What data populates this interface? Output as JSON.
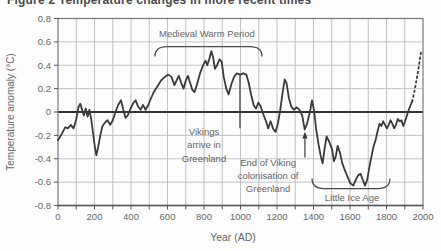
{
  "chart_data": {
    "type": "line",
    "title": "Figure 2 Temperature changes in more recent times",
    "xlabel": "Year (AD)",
    "ylabel": "Temperature anomaly (°C)",
    "xlim": [
      0,
      2000
    ],
    "ylim": [
      -0.8,
      0.8
    ],
    "grid": true,
    "legend": "none",
    "x_ticks": [
      0,
      200,
      400,
      600,
      800,
      1000,
      1200,
      1400,
      1600,
      1800,
      2000
    ],
    "x_minor_step": 100,
    "y_ticks": [
      0.8,
      0.6,
      0.4,
      0.2,
      0,
      -0.2,
      -0.4,
      -0.6,
      -0.8
    ],
    "y_tick_labels": [
      "0.8",
      "0.6",
      "0.4",
      "0.2",
      "0",
      "-0.2",
      "-0.4",
      "-0.6",
      "-0.8"
    ],
    "curve_color": "#3a3a3a",
    "series": [
      {
        "name": "temperature anomaly (reconstructed, solid)",
        "style": "solid",
        "points": [
          [
            0,
            -0.24
          ],
          [
            20,
            -0.19
          ],
          [
            40,
            -0.13
          ],
          [
            55,
            -0.14
          ],
          [
            70,
            -0.11
          ],
          [
            85,
            -0.14
          ],
          [
            100,
            -0.06
          ],
          [
            112,
            0.04
          ],
          [
            122,
            0.07
          ],
          [
            132,
            0.02
          ],
          [
            142,
            -0.03
          ],
          [
            152,
            0.03
          ],
          [
            162,
            -0.04
          ],
          [
            172,
            0.02
          ],
          [
            182,
            -0.06
          ],
          [
            192,
            -0.18
          ],
          [
            202,
            -0.3
          ],
          [
            210,
            -0.37
          ],
          [
            220,
            -0.3
          ],
          [
            232,
            -0.2
          ],
          [
            244,
            -0.12
          ],
          [
            258,
            -0.09
          ],
          [
            272,
            -0.07
          ],
          [
            286,
            -0.11
          ],
          [
            300,
            -0.07
          ],
          [
            315,
            0
          ],
          [
            330,
            0.06
          ],
          [
            345,
            0.1
          ],
          [
            358,
            0.02
          ],
          [
            370,
            -0.05
          ],
          [
            382,
            -0.03
          ],
          [
            395,
            0.02
          ],
          [
            410,
            0.07
          ],
          [
            425,
            0.1
          ],
          [
            438,
            0.05
          ],
          [
            452,
            0.02
          ],
          [
            466,
            0.06
          ],
          [
            480,
            0.02
          ],
          [
            495,
            0.06
          ],
          [
            510,
            0.12
          ],
          [
            525,
            0.17
          ],
          [
            545,
            0.22
          ],
          [
            565,
            0.27
          ],
          [
            585,
            0.3
          ],
          [
            605,
            0.32
          ],
          [
            622,
            0.3
          ],
          [
            638,
            0.23
          ],
          [
            650,
            0.27
          ],
          [
            662,
            0.31
          ],
          [
            675,
            0.25
          ],
          [
            688,
            0.2
          ],
          [
            700,
            0.27
          ],
          [
            712,
            0.31
          ],
          [
            724,
            0.25
          ],
          [
            736,
            0.19
          ],
          [
            748,
            0.17
          ],
          [
            762,
            0.24
          ],
          [
            778,
            0.33
          ],
          [
            795,
            0.4
          ],
          [
            808,
            0.44
          ],
          [
            818,
            0.4
          ],
          [
            830,
            0.46
          ],
          [
            840,
            0.52
          ],
          [
            850,
            0.47
          ],
          [
            860,
            0.37
          ],
          [
            872,
            0.4
          ],
          [
            885,
            0.45
          ],
          [
            897,
            0.43
          ],
          [
            908,
            0.3
          ],
          [
            922,
            0.2
          ],
          [
            935,
            0.15
          ],
          [
            950,
            0.24
          ],
          [
            965,
            0.3
          ],
          [
            980,
            0.33
          ],
          [
            1000,
            0.32
          ],
          [
            1015,
            0.33
          ],
          [
            1032,
            0.32
          ],
          [
            1045,
            0.25
          ],
          [
            1058,
            0.15
          ],
          [
            1072,
            0.06
          ],
          [
            1085,
            0.03
          ],
          [
            1098,
            0.08
          ],
          [
            1110,
            0.05
          ],
          [
            1125,
            -0.02
          ],
          [
            1140,
            -0.08
          ],
          [
            1152,
            -0.14
          ],
          [
            1165,
            -0.08
          ],
          [
            1178,
            -0.14
          ],
          [
            1192,
            -0.17
          ],
          [
            1205,
            -0.1
          ],
          [
            1218,
            0.02
          ],
          [
            1230,
            0.16
          ],
          [
            1242,
            0.28
          ],
          [
            1252,
            0.25
          ],
          [
            1265,
            0.12
          ],
          [
            1278,
            0.05
          ],
          [
            1292,
            0.02
          ],
          [
            1308,
            0.04
          ],
          [
            1322,
            0.02
          ],
          [
            1338,
            -0.03
          ],
          [
            1352,
            -0.15
          ],
          [
            1365,
            -0.1
          ],
          [
            1380,
            0
          ],
          [
            1392,
            0.1
          ],
          [
            1402,
            0.02
          ],
          [
            1415,
            -0.15
          ],
          [
            1428,
            -0.28
          ],
          [
            1440,
            -0.38
          ],
          [
            1450,
            -0.44
          ],
          [
            1462,
            -0.3
          ],
          [
            1472,
            -0.21
          ],
          [
            1482,
            -0.24
          ],
          [
            1492,
            -0.28
          ],
          [
            1502,
            -0.32
          ],
          [
            1512,
            -0.42
          ],
          [
            1522,
            -0.38
          ],
          [
            1532,
            -0.29
          ],
          [
            1545,
            -0.35
          ],
          [
            1558,
            -0.44
          ],
          [
            1572,
            -0.5
          ],
          [
            1588,
            -0.56
          ],
          [
            1602,
            -0.61
          ],
          [
            1618,
            -0.63
          ],
          [
            1632,
            -0.58
          ],
          [
            1645,
            -0.54
          ],
          [
            1658,
            -0.53
          ],
          [
            1670,
            -0.58
          ],
          [
            1682,
            -0.63
          ],
          [
            1694,
            -0.58
          ],
          [
            1705,
            -0.48
          ],
          [
            1715,
            -0.4
          ],
          [
            1728,
            -0.3
          ],
          [
            1740,
            -0.24
          ],
          [
            1752,
            -0.16
          ],
          [
            1762,
            -0.1
          ],
          [
            1772,
            -0.12
          ],
          [
            1782,
            -0.08
          ],
          [
            1792,
            -0.11
          ],
          [
            1802,
            -0.14
          ],
          [
            1812,
            -0.11
          ],
          [
            1822,
            -0.07
          ],
          [
            1832,
            -0.1
          ],
          [
            1842,
            -0.14
          ],
          [
            1852,
            -0.11
          ],
          [
            1862,
            -0.06
          ],
          [
            1872,
            -0.08
          ],
          [
            1882,
            -0.07
          ],
          [
            1892,
            -0.12
          ],
          [
            1902,
            -0.08
          ],
          [
            1912,
            -0.03
          ],
          [
            1922,
            0.02
          ],
          [
            1932,
            0.06
          ],
          [
            1940,
            0.09
          ]
        ]
      },
      {
        "name": "recent warming (dotted)",
        "style": "dotted",
        "points": [
          [
            1940,
            0.09
          ],
          [
            1948,
            0.14
          ],
          [
            1956,
            0.2
          ],
          [
            1963,
            0.26
          ],
          [
            1970,
            0.32
          ],
          [
            1976,
            0.38
          ],
          [
            1982,
            0.44
          ],
          [
            1987,
            0.49
          ],
          [
            1991,
            0.53
          ]
        ]
      }
    ],
    "annotations": [
      {
        "id": "medieval-warm-period",
        "type": "bracket-down",
        "label": "Medieval Warm Period",
        "x_range": [
          531,
          1118
        ],
        "value": 0.56,
        "label_year": 816,
        "label_value": 0.67
      },
      {
        "id": "vikings-arrive-in-greenland",
        "type": "marker-line",
        "lines": [
          "Vikings",
          "arrive in",
          "Greenland"
        ],
        "marker_year": 997,
        "marker_from": -0.14,
        "marker_to": 0.32,
        "label_year": 800,
        "label_value": -0.17
      },
      {
        "id": "end-of-viking-colonisation",
        "type": "marker-arrow",
        "lines": [
          "End of Viking",
          "colonisation of",
          "Greenland"
        ],
        "marker_year": 1353,
        "marker_from": -0.39,
        "marker_to": -0.18,
        "label_year": 1151,
        "label_value": -0.43
      },
      {
        "id": "little-ice-age",
        "type": "bracket-up",
        "label": "Little Ice Age",
        "x_range": [
          1392,
          1819
        ],
        "value": -0.655,
        "label_year": 1611,
        "label_value": -0.735
      }
    ]
  }
}
